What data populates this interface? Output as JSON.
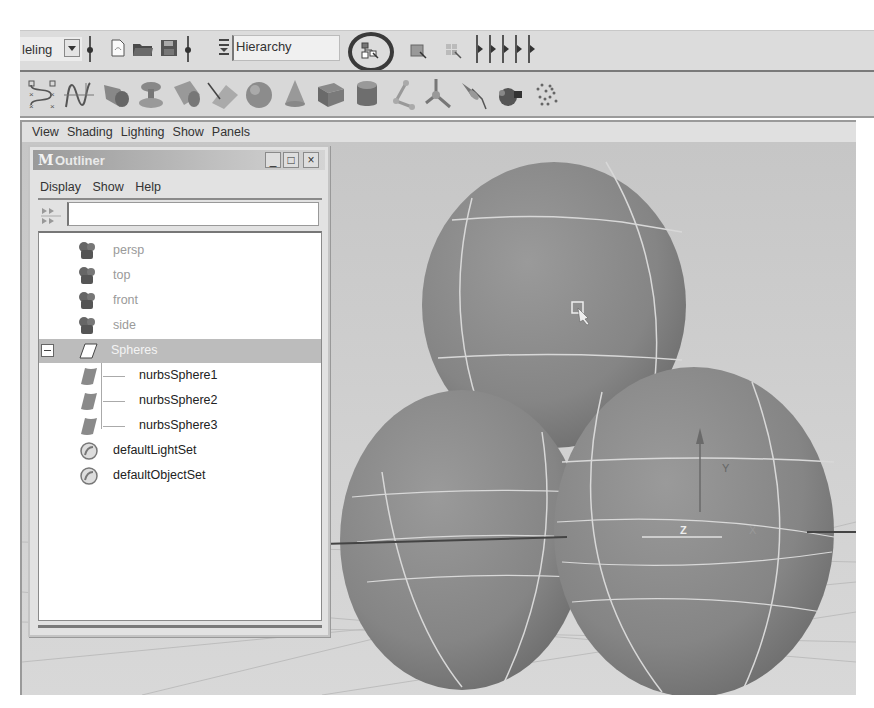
{
  "statusline": {
    "mode_value": "leling",
    "hierarchy_field": "Hierarchy",
    "highlighted_tool": "select-by-hierarchy-icon"
  },
  "shelf": {
    "icons": [
      "cv-curve-icon",
      "ep-curve-icon",
      "revolve-icon",
      "loft-icon",
      "extrude-icon",
      "planar-icon",
      "sphere-icon",
      "cone-icon",
      "cube-icon",
      "cylinder-icon",
      "joint-icon",
      "ik-handle-icon",
      "spotlight-icon",
      "paint-effects-icon",
      "particles-icon"
    ]
  },
  "panel_menu": {
    "items": [
      "View",
      "Shading",
      "Lighting",
      "Show",
      "Panels"
    ]
  },
  "outliner": {
    "title": "Outliner",
    "logo": "M",
    "window_buttons": [
      "_",
      "□",
      "×"
    ],
    "menu": [
      "Display",
      "Show",
      "Help"
    ],
    "search_value": "",
    "tree": [
      {
        "label": "persp",
        "icon": "camera-icon",
        "dimmed": true,
        "indent": 0
      },
      {
        "label": "top",
        "icon": "camera-icon",
        "dimmed": true,
        "indent": 0
      },
      {
        "label": "front",
        "icon": "camera-icon",
        "dimmed": true,
        "indent": 0
      },
      {
        "label": "side",
        "icon": "camera-icon",
        "dimmed": true,
        "indent": 0
      },
      {
        "label": "Spheres",
        "icon": "group-icon",
        "selected": true,
        "expanded": true,
        "indent": 0
      },
      {
        "label": "nurbsSphere1",
        "icon": "nurbs-surface-icon",
        "indent": 1
      },
      {
        "label": "nurbsSphere2",
        "icon": "nurbs-surface-icon",
        "indent": 1
      },
      {
        "label": "nurbsSphere3",
        "icon": "nurbs-surface-icon",
        "indent": 1
      },
      {
        "label": "defaultLightSet",
        "icon": "set-icon",
        "indent": 0
      },
      {
        "label": "defaultObjectSet",
        "icon": "set-icon",
        "indent": 0
      }
    ]
  },
  "viewport": {
    "axis_labels": {
      "y": "Y",
      "z": "Z",
      "x": "X"
    },
    "objects": [
      "nurbsSphere1",
      "nurbsSphere2",
      "nurbsSphere3"
    ]
  }
}
